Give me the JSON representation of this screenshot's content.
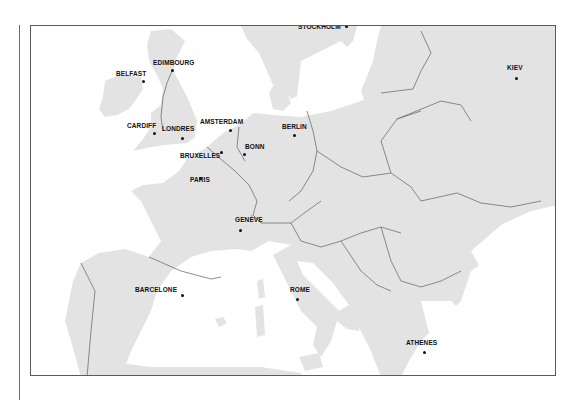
{
  "map": {
    "title": "Europe",
    "colors": {
      "land": "#e3e3e3",
      "sea": "#ffffff",
      "border": "#707070",
      "frame": "#5a5a5a",
      "text": "#111111"
    },
    "cities": [
      {
        "name": "STOCKHOLM",
        "dot": [
          345,
          25
        ],
        "label": [
          297,
          26
        ]
      },
      {
        "name": "EDIMBOURG",
        "dot": [
          171,
          69
        ],
        "label": [
          152,
          62
        ]
      },
      {
        "name": "BELFAST",
        "dot": [
          142,
          80
        ],
        "label": [
          115,
          73
        ]
      },
      {
        "name": "KIEV",
        "dot": [
          515,
          77
        ],
        "label": [
          506,
          67
        ]
      },
      {
        "name": "AMSTERDAM",
        "dot": [
          229,
          129
        ],
        "label": [
          199,
          121
        ]
      },
      {
        "name": "CARDIFF",
        "dot": [
          153,
          132
        ],
        "label": [
          126,
          125
        ]
      },
      {
        "name": "LONDRES",
        "dot": [
          181,
          137
        ],
        "label": [
          161,
          128
        ]
      },
      {
        "name": "BERLIN",
        "dot": [
          293,
          134
        ],
        "label": [
          281,
          126
        ]
      },
      {
        "name": "BONN",
        "dot": [
          243,
          153
        ],
        "label": [
          244,
          146
        ]
      },
      {
        "name": "BRUXELLES",
        "dot": [
          220,
          151
        ],
        "label": [
          179,
          155
        ]
      },
      {
        "name": "PARIS",
        "dot": [
          199,
          177
        ],
        "label": [
          189,
          179
        ]
      },
      {
        "name": "GENÈVE",
        "dot": [
          239,
          229
        ],
        "label": [
          234,
          219
        ]
      },
      {
        "name": "BARCELONE",
        "dot": [
          181,
          294
        ],
        "label": [
          134,
          289
        ]
      },
      {
        "name": "ROME",
        "dot": [
          296,
          298
        ],
        "label": [
          289,
          289
        ]
      },
      {
        "name": "ATHENES",
        "dot": [
          423,
          351
        ],
        "label": [
          405,
          342
        ]
      }
    ]
  }
}
